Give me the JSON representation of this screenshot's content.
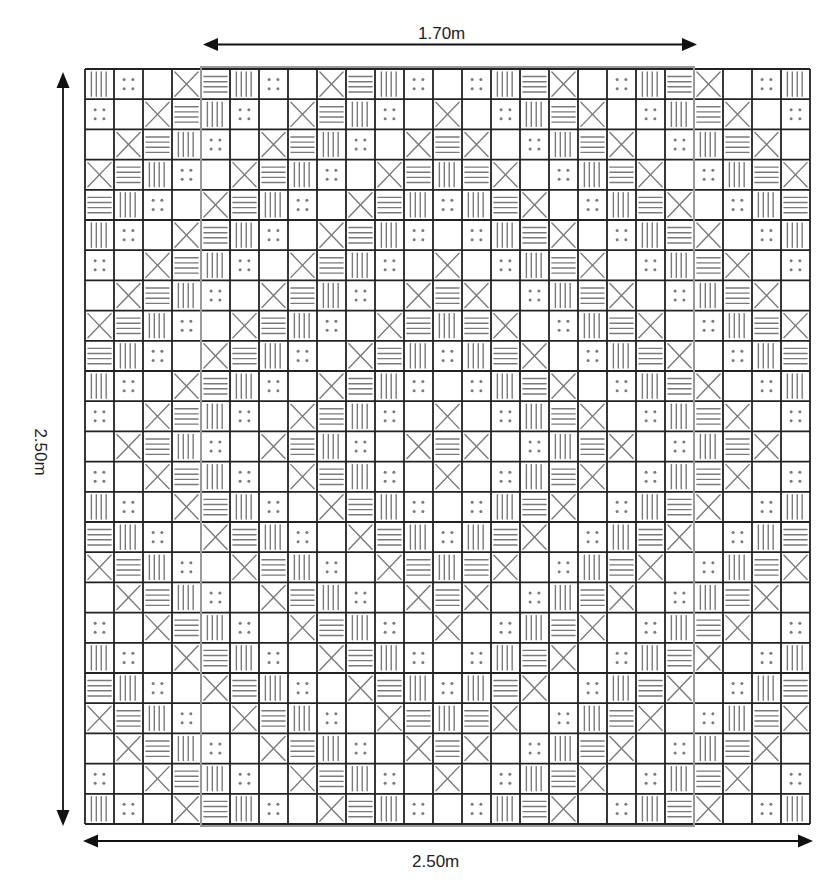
{
  "diagram": {
    "dimensions": {
      "top_label": "1.70m",
      "bottom_label": "2.50m",
      "left_label": "2.50m"
    },
    "grid": {
      "rows": 25,
      "cols": 25,
      "origin_x": 85,
      "origin_y": 69,
      "cell_width": 29,
      "cell_height": 30.2,
      "line_color": "#222222",
      "motif_color": "#7a7a7a",
      "motif_sequence": [
        "vertical-lines",
        "four-dots",
        "empty",
        "x-cross",
        "horizontal-lines"
      ],
      "rule": "motif index = (min(r,24-r) + min(c,24-c)) mod 5"
    },
    "highlight_rect": {
      "col_start": 4,
      "col_end": 20,
      "color": "#9a9a9a",
      "represents": "1.70m"
    },
    "colors": {
      "background": "#ffffff",
      "arrow": "#111111"
    }
  }
}
